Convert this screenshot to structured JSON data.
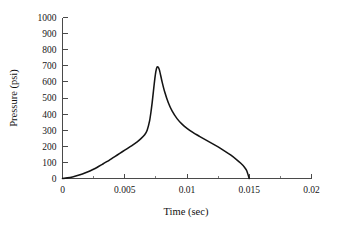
{
  "chart_data": {
    "type": "line",
    "title": "",
    "xlabel": "Time (sec)",
    "ylabel": "Pressure (psi)",
    "xlim": [
      0,
      0.02
    ],
    "ylim": [
      0,
      1000
    ],
    "grid": false,
    "legend": null,
    "legend_position": "none",
    "frame": "open-left-bottom",
    "curve_color": "#141414",
    "axis_color": "#4a4a4a",
    "background_color": "#ffffff",
    "x_ticks": [
      0,
      0.005,
      0.01,
      0.015,
      0.02
    ],
    "x_tick_labels": [
      "0",
      "0.005",
      "0.01",
      "0.015",
      "0.02"
    ],
    "x_minor_ticks": [
      0.0025,
      0.0075,
      0.0125,
      0.0175
    ],
    "y_ticks": [
      0,
      100,
      200,
      300,
      400,
      500,
      600,
      700,
      800,
      900,
      1000
    ],
    "y_tick_labels": [
      "0",
      "100",
      "200",
      "300",
      "400",
      "500",
      "600",
      "700",
      "800",
      "900",
      "1000"
    ],
    "peak": {
      "x": 0.0076,
      "y": 695
    },
    "series": [
      {
        "name": "Pressure",
        "x": [
          0.0,
          0.0004,
          0.0008,
          0.0012,
          0.0016,
          0.002,
          0.0024,
          0.0028,
          0.0032,
          0.0036,
          0.004,
          0.0044,
          0.0048,
          0.0052,
          0.0056,
          0.006,
          0.0063,
          0.0066,
          0.0068,
          0.007,
          0.0071,
          0.0072,
          0.0073,
          0.0074,
          0.0075,
          0.0076,
          0.0077,
          0.0078,
          0.008,
          0.0082,
          0.0085,
          0.0088,
          0.0092,
          0.0096,
          0.01,
          0.0105,
          0.011,
          0.0115,
          0.012,
          0.0125,
          0.013,
          0.0135,
          0.014,
          0.0143,
          0.0146,
          0.0148,
          0.015
        ],
        "y": [
          0,
          4,
          10,
          18,
          28,
          40,
          54,
          70,
          88,
          106,
          126,
          146,
          166,
          186,
          206,
          228,
          248,
          272,
          300,
          360,
          410,
          470,
          540,
          610,
          665,
          693,
          690,
          670,
          600,
          540,
          470,
          420,
          372,
          338,
          312,
          285,
          262,
          240,
          218,
          196,
          172,
          146,
          116,
          96,
          72,
          48,
          0
        ]
      }
    ]
  },
  "axes": {
    "x_title": "Time (sec)",
    "y_title": "Pressure (psi)"
  }
}
